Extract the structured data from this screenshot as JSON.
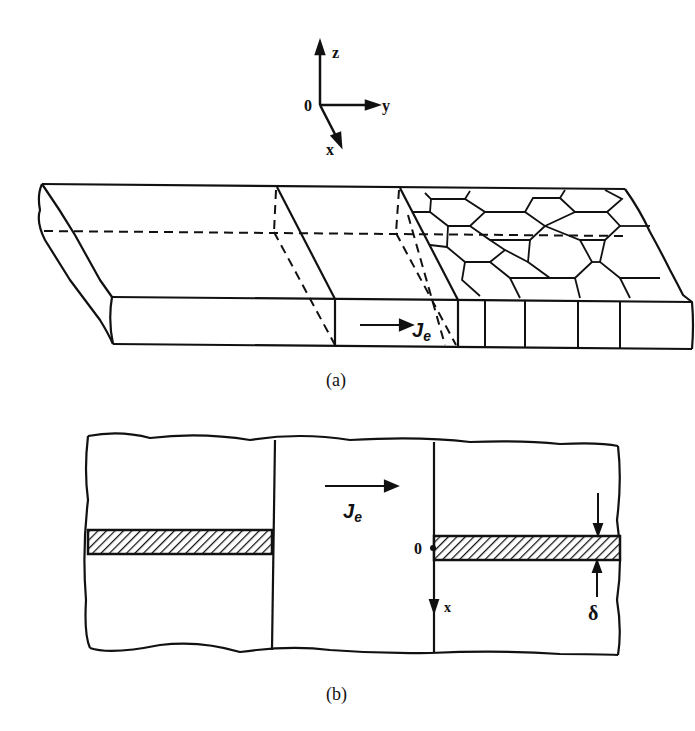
{
  "figure": {
    "axes_3d": {
      "origin": "0",
      "x_label": "x",
      "y_label": "y",
      "z_label": "z"
    },
    "panel_a": {
      "caption": "(a)",
      "current_label": "J",
      "current_subscript": "e",
      "description": "Thin film strip with single-crystal section and polycrystalline (hexagonal grain) section; current density J_e flows along +y"
    },
    "panel_b": {
      "caption": "(b)",
      "current_label": "J",
      "current_subscript": "e",
      "origin_label": "0",
      "x_axis_label": "x",
      "thickness_label": "δ",
      "description": "Top view with hatched void/slit region of width δ"
    },
    "colors": {
      "ink": "#111111",
      "background": "#ffffff"
    }
  }
}
